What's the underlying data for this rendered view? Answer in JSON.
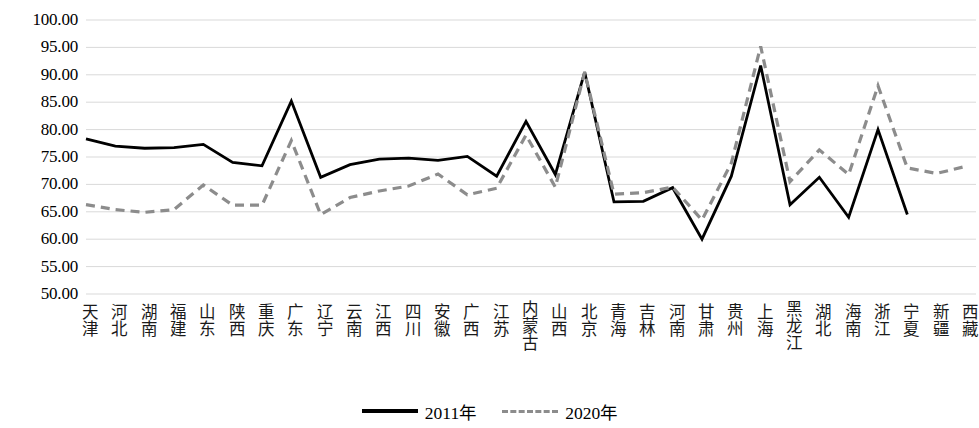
{
  "chart_data": {
    "type": "line",
    "title": "",
    "xlabel": "",
    "ylabel": "",
    "ylim": [
      50.0,
      100.0
    ],
    "ytick_step": 5.0,
    "ytick_labels": [
      "100.00",
      "95.00",
      "90.00",
      "85.00",
      "80.00",
      "75.00",
      "70.00",
      "65.00",
      "60.00",
      "55.00",
      "50.00"
    ],
    "ytick_values": [
      100,
      95,
      90,
      85,
      80,
      75,
      70,
      65,
      60,
      55,
      50
    ],
    "grid": true,
    "grid_color": "#d9d9d9",
    "legend_position": "bottom-center",
    "categories": [
      "天津",
      "河北",
      "湖南",
      "福建",
      "山东",
      "陕西",
      "重庆",
      "广东",
      "辽宁",
      "云南",
      "江西",
      "四川",
      "安徽",
      "广西",
      "江苏",
      "内蒙古",
      "山西",
      "北京",
      "青海",
      "吉林",
      "河南",
      "甘肃",
      "贵州",
      "上海",
      "黑龙江",
      "湖北",
      "海南",
      "浙江",
      "宁夏",
      "新疆",
      "西藏"
    ],
    "series": [
      {
        "name": "2011年",
        "color": "#000000",
        "style": "solid",
        "values": [
          78.3,
          77.0,
          76.6,
          76.7,
          77.3,
          74.0,
          73.4,
          85.2,
          71.3,
          73.6,
          74.6,
          74.8,
          74.4,
          75.1,
          71.5,
          81.5,
          71.8,
          90.5,
          66.8,
          66.9,
          69.4,
          60.0,
          71.5,
          91.7,
          66.3,
          71.3,
          64.0,
          80.0,
          64.5,
          null,
          null
        ]
      },
      {
        "name": "2020年",
        "color": "#8c8c8c",
        "style": "dashed",
        "values": [
          66.3,
          65.4,
          64.9,
          65.4,
          69.9,
          66.2,
          66.2,
          78.0,
          64.5,
          67.6,
          68.8,
          69.7,
          71.9,
          68.1,
          69.3,
          79.0,
          69.5,
          90.5,
          68.2,
          68.5,
          69.5,
          63.5,
          73.9,
          95.2,
          70.5,
          76.3,
          71.8,
          88.0,
          73.0,
          72.0,
          73.3
        ]
      }
    ]
  },
  "legend": {
    "items": [
      {
        "label": "2011年"
      },
      {
        "label": "2020年"
      }
    ]
  }
}
